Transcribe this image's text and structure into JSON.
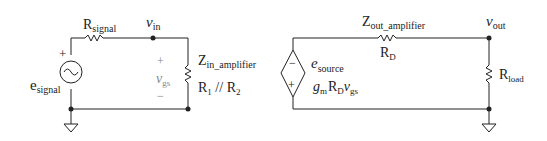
{
  "left_circuit": {
    "source_label": "e",
    "source_sub": "signal",
    "source_plus": "+",
    "series_resistor": "R",
    "series_resistor_sub": "signal",
    "node_label": "v",
    "node_sub": "in",
    "vgs_plus": "+",
    "vgs_label": "v",
    "vgs_sub": "gs",
    "vgs_minus": "−",
    "zin_label": "Z",
    "zin_sub": "in_amplifier",
    "zin_value_r1": "R",
    "zin_value_r1_sub": "1",
    "zin_value_sep": " // ",
    "zin_value_r2": "R",
    "zin_value_r2_sub": "2"
  },
  "right_circuit": {
    "dep_minus": "−",
    "dep_plus": "+",
    "source_label": "e",
    "source_sub": "source",
    "gain_g": "g",
    "gain_g_sub": "m",
    "gain_r": "R",
    "gain_r_sub": "D",
    "gain_v": "v",
    "gain_v_sub": "gs",
    "zout_label": "Z",
    "zout_sub": "out_amplifier",
    "rd_label": "R",
    "rd_sub": "D",
    "node_label": "v",
    "node_sub": "out",
    "load_label": "R",
    "load_sub": "load"
  }
}
